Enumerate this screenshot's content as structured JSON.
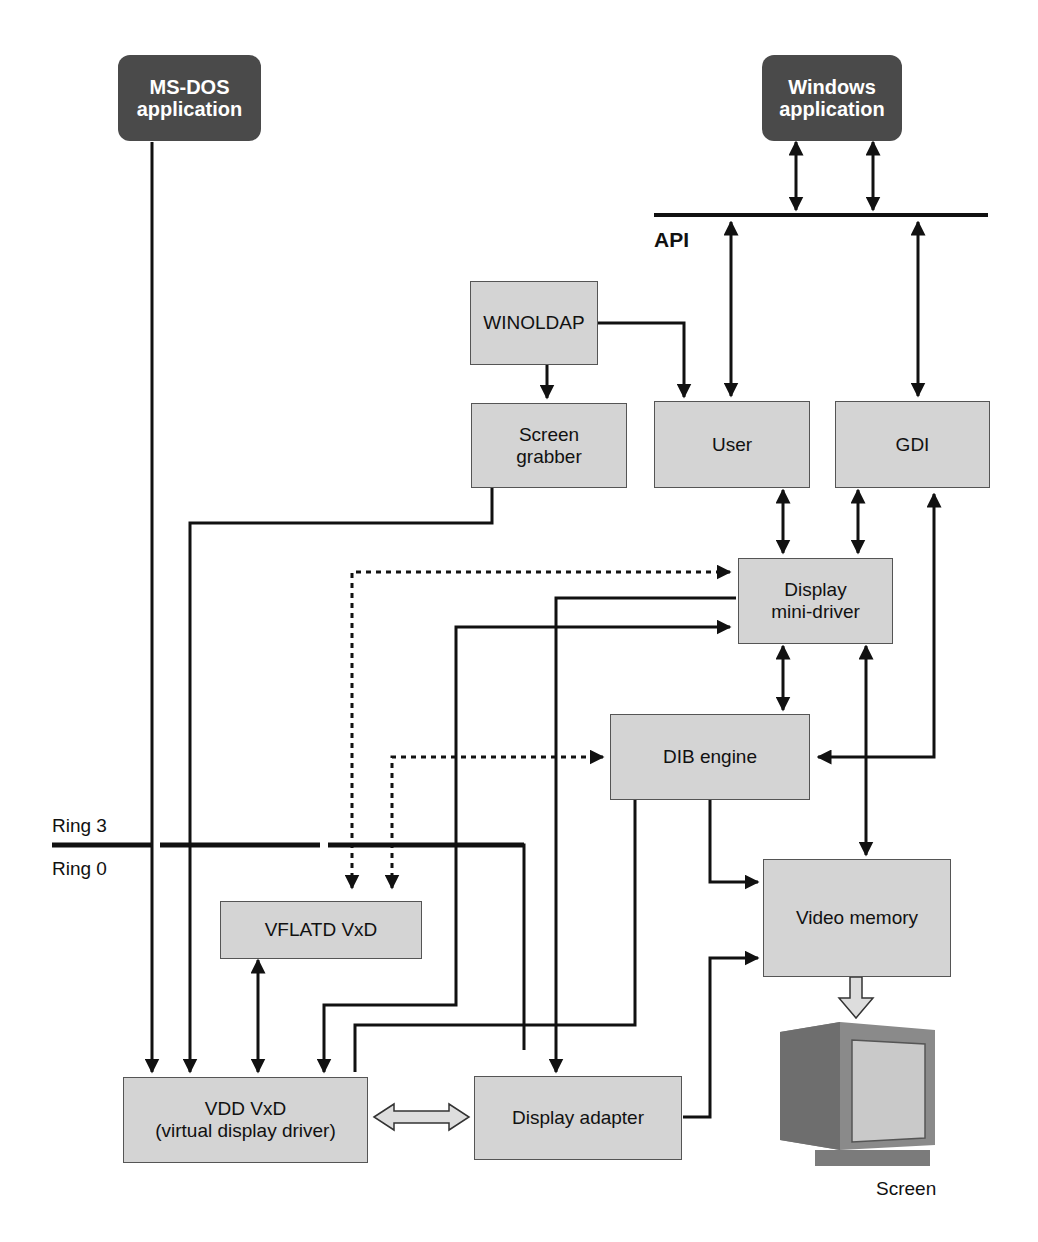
{
  "diagram": {
    "type": "architecture-flow",
    "nodes": {
      "msdos_app": {
        "label": "MS-DOS\napplication",
        "style": "dark"
      },
      "windows_app": {
        "label": "Windows\napplication",
        "style": "dark"
      },
      "winoldap": {
        "label": "WINOLDAP"
      },
      "screen_grabber": {
        "label": "Screen\ngrabber"
      },
      "user": {
        "label": "User"
      },
      "gdi": {
        "label": "GDI"
      },
      "display_minidriver": {
        "label": "Display\nmini-driver"
      },
      "dib_engine": {
        "label": "DIB engine"
      },
      "video_memory": {
        "label": "Video memory"
      },
      "vflatd": {
        "label": "VFLATD VxD"
      },
      "vdd": {
        "label": "VDD VxD\n(virtual display driver)"
      },
      "display_adapter": {
        "label": "Display adapter"
      },
      "screen": {
        "label": "Screen"
      }
    },
    "labels": {
      "api": "API",
      "ring3": "Ring 3",
      "ring0": "Ring 0"
    },
    "edges": [
      {
        "from": "windows_app",
        "to": "api",
        "style": "bidirectional"
      },
      {
        "from": "windows_app",
        "to": "api",
        "style": "bidirectional"
      },
      {
        "from": "api",
        "to": "user",
        "style": "bidirectional"
      },
      {
        "from": "api",
        "to": "gdi",
        "style": "bidirectional"
      },
      {
        "from": "winoldap",
        "to": "user",
        "style": "solid"
      },
      {
        "from": "winoldap",
        "to": "screen_grabber",
        "style": "solid"
      },
      {
        "from": "user",
        "to": "display_minidriver",
        "style": "bidirectional"
      },
      {
        "from": "gdi",
        "to": "display_minidriver",
        "style": "bidirectional"
      },
      {
        "from": "display_minidriver",
        "to": "dib_engine",
        "style": "bidirectional"
      },
      {
        "from": "display_minidriver",
        "to": "video_memory",
        "style": "bidirectional"
      },
      {
        "from": "dib_engine",
        "to": "gdi",
        "style": "bidirectional"
      },
      {
        "from": "dib_engine",
        "to": "video_memory",
        "style": "solid"
      },
      {
        "from": "vflatd",
        "to": "display_minidriver",
        "style": "dotted-bidirectional"
      },
      {
        "from": "vflatd",
        "to": "dib_engine",
        "style": "dotted-bidirectional"
      },
      {
        "from": "msdos_app",
        "to": "vdd",
        "style": "solid"
      },
      {
        "from": "screen_grabber",
        "to": "vdd",
        "style": "solid"
      },
      {
        "from": "vflatd",
        "to": "vdd",
        "style": "bidirectional"
      },
      {
        "from": "vdd",
        "to": "display_minidriver",
        "style": "bidirectional"
      },
      {
        "from": "vdd",
        "to": "dib_engine",
        "style": "solid"
      },
      {
        "from": "display_minidriver",
        "to": "display_adapter",
        "style": "solid"
      },
      {
        "from": "vdd",
        "to": "display_adapter",
        "style": "hollow-bidirectional"
      },
      {
        "from": "display_adapter",
        "to": "video_memory",
        "style": "solid"
      },
      {
        "from": "video_memory",
        "to": "screen",
        "style": "hollow"
      }
    ]
  }
}
